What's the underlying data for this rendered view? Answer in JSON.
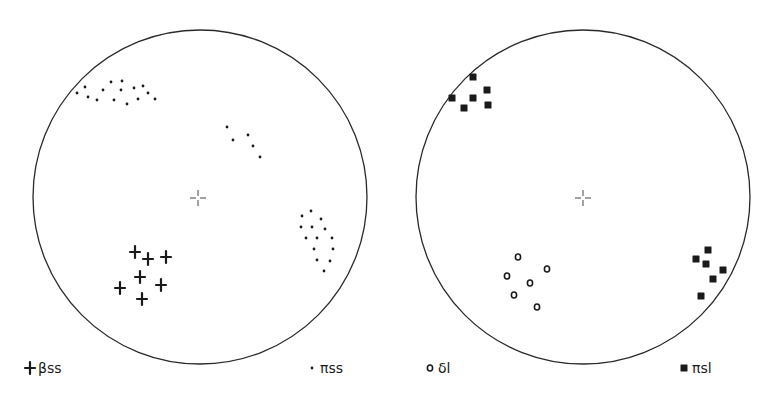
{
  "figure": {
    "panels": [
      {
        "id": "left",
        "net": {
          "cx": 200,
          "cy": 197,
          "r": 167
        },
        "center_mark": {
          "x": 198,
          "y": 198
        },
        "legend": [
          {
            "symbol": "cross",
            "label": "βss",
            "x": 30,
            "y": 369
          },
          {
            "symbol": "dot",
            "label": "πss",
            "x": 312,
            "y": 369
          }
        ]
      },
      {
        "id": "right",
        "net": {
          "cx": 583,
          "cy": 197,
          "r": 167
        },
        "center_mark": {
          "x": 583,
          "y": 198
        },
        "legend": [
          {
            "symbol": "ring",
            "label": "δl",
            "x": 430,
            "y": 369
          },
          {
            "symbol": "square",
            "label": "πsl",
            "x": 684,
            "y": 369
          }
        ]
      }
    ]
  },
  "chart_data": {
    "type": "scatter",
    "title": "",
    "panels": [
      {
        "panel": "left",
        "series": [
          {
            "name": "βss",
            "marker": "cross",
            "points": [
              [
                135,
                252
              ],
              [
                148,
                259
              ],
              [
                166,
                257
              ],
              [
                140,
                277
              ],
              [
                120,
                288
              ],
              [
                161,
                285
              ],
              [
                142,
                299
              ]
            ]
          },
          {
            "name": "πss",
            "marker": "dot",
            "clusters": [
              {
                "location": "upper-left",
                "points": [
                  [
                    77,
                    93
                  ],
                  [
                    85,
                    87
                  ],
                  [
                    88,
                    97
                  ],
                  [
                    97,
                    100
                  ],
                  [
                    103,
                    90
                  ],
                  [
                    111,
                    82
                  ],
                  [
                    114,
                    100
                  ],
                  [
                    122,
                    81
                  ],
                  [
                    121,
                    90
                  ],
                  [
                    127,
                    104
                  ],
                  [
                    134,
                    88
                  ],
                  [
                    138,
                    99
                  ],
                  [
                    143,
                    86
                  ],
                  [
                    148,
                    93
                  ],
                  [
                    155,
                    99
                  ]
                ]
              },
              {
                "location": "upper-right",
                "points": [
                  [
                    227,
                    127
                  ],
                  [
                    233,
                    140
                  ],
                  [
                    248,
                    135
                  ],
                  [
                    253,
                    146
                  ],
                  [
                    260,
                    157
                  ]
                ]
              },
              {
                "location": "right",
                "points": [
                  [
                    311,
                    211
                  ],
                  [
                    302,
                    216
                  ],
                  [
                    321,
                    219
                  ],
                  [
                    301,
                    227
                  ],
                  [
                    312,
                    227
                  ],
                  [
                    325,
                    229
                  ],
                  [
                    306,
                    238
                  ],
                  [
                    317,
                    238
                  ],
                  [
                    332,
                    238
                  ],
                  [
                    314,
                    249
                  ],
                  [
                    333,
                    249
                  ],
                  [
                    317,
                    260
                  ],
                  [
                    330,
                    261
                  ],
                  [
                    324,
                    271
                  ]
                ]
              }
            ]
          }
        ]
      },
      {
        "panel": "right",
        "series": [
          {
            "name": "δl",
            "marker": "open-circle",
            "points": [
              [
                518,
                257
              ],
              [
                547,
                269
              ],
              [
                507,
                276
              ],
              [
                530,
                283
              ],
              [
                514,
                295
              ],
              [
                537,
                307
              ]
            ]
          },
          {
            "name": "πsl",
            "marker": "filled-square",
            "clusters": [
              {
                "location": "upper-left",
                "points": [
                  [
                    473,
                    77
                  ],
                  [
                    487,
                    90
                  ],
                  [
                    452,
                    98
                  ],
                  [
                    473,
                    98
                  ],
                  [
                    464,
                    108
                  ],
                  [
                    488,
                    105
                  ]
                ]
              },
              {
                "location": "lower-right",
                "points": [
                  [
                    708,
                    250
                  ],
                  [
                    696,
                    259
                  ],
                  [
                    706,
                    264
                  ],
                  [
                    723,
                    270
                  ],
                  [
                    713,
                    279
                  ],
                  [
                    701,
                    296
                  ]
                ]
              }
            ]
          }
        ]
      }
    ],
    "legend": [
      "βss",
      "πss",
      "δl",
      "πsl"
    ],
    "grid": false
  }
}
